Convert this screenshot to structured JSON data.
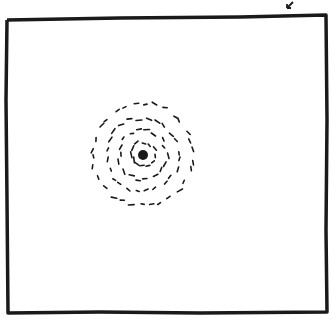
{
  "drawing": {
    "description": "Hand-drawn sketch: square frame with concentric spiral of dots around a dark central blob",
    "colors": {
      "ink": "#1a1a1a",
      "paper": "#ffffff"
    },
    "frame": {
      "points": [
        [
          7,
          20
        ],
        [
          120,
          18
        ],
        [
          240,
          17
        ],
        [
          326,
          15
        ],
        [
          327,
          120
        ],
        [
          326,
          230
        ],
        [
          327,
          312
        ],
        [
          200,
          313
        ],
        [
          100,
          312
        ],
        [
          8,
          313
        ],
        [
          7,
          200
        ],
        [
          6,
          100
        ],
        [
          7,
          20
        ]
      ]
    },
    "arrow_mark": {
      "x": 287,
      "y": 2
    },
    "center": {
      "x": 143,
      "y": 155,
      "r": 5
    },
    "rings": [
      {
        "radius": 12,
        "count": 12
      },
      {
        "radius": 24,
        "count": 18
      },
      {
        "radius": 36,
        "count": 24
      },
      {
        "radius": 50,
        "count": 30
      }
    ]
  }
}
